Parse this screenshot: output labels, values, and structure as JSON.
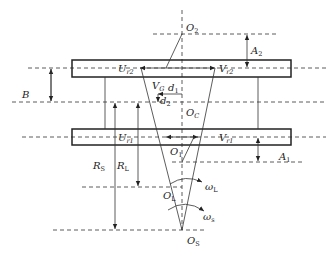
{
  "diagram": {
    "type": "geometric-kinematic-schematic",
    "labels": {
      "O2": {
        "main": "O",
        "sub": "2"
      },
      "A2": {
        "main": "A",
        "sub": "2"
      },
      "Ur2": {
        "main": "U",
        "sub": "r2"
      },
      "Vr2": {
        "main": "V",
        "sub": "r2"
      },
      "B": {
        "main": "B",
        "sub": ""
      },
      "VG": {
        "main": "V",
        "sub": "G"
      },
      "d1": {
        "main": "d",
        "sub": "1"
      },
      "d2": {
        "main": "d",
        "sub": "2"
      },
      "OC": {
        "main": "O",
        "sub": "C"
      },
      "Ur1": {
        "main": "U",
        "sub": "r1"
      },
      "Vr1": {
        "main": "V",
        "sub": "r1"
      },
      "O1": {
        "main": "O",
        "sub": "1"
      },
      "A1": {
        "main": "A",
        "sub": "1"
      },
      "RS": {
        "main": "R",
        "sub": "S"
      },
      "RL": {
        "main": "R",
        "sub": "L"
      },
      "OL": {
        "main": "O",
        "sub": "L"
      },
      "omegaL": {
        "main": "ω",
        "sub": "L"
      },
      "omegaS": {
        "main": "ω",
        "sub": "s"
      },
      "OS": {
        "main": "O",
        "sub": "S"
      }
    }
  }
}
